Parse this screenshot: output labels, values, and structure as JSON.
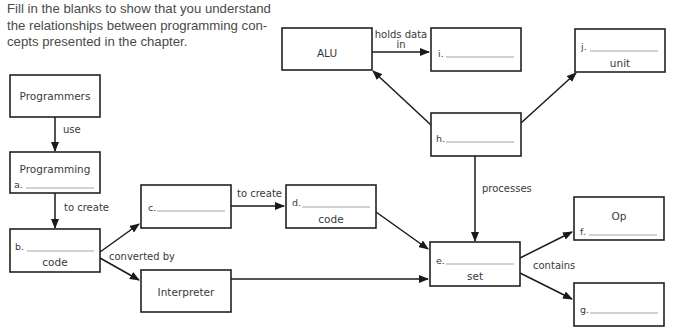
{
  "instructions": {
    "lines": [
      "Fill in the blanks to show that you understand",
      "the relationships between programming con-",
      "cepts presented in the chapter."
    ]
  },
  "nodes": {
    "programmers": {
      "title": "Programmers"
    },
    "programming": {
      "title": "Programming",
      "blank_letter": "a."
    },
    "b": {
      "blank_letter": "b.",
      "suffix": "code"
    },
    "c": {
      "blank_letter": "c."
    },
    "d": {
      "blank_letter": "d.",
      "suffix": "code"
    },
    "interpreter": {
      "title": "Interpreter"
    },
    "alu": {
      "title": "ALU"
    },
    "i": {
      "blank_letter": "i."
    },
    "h": {
      "blank_letter": "h."
    },
    "j": {
      "blank_letter": "j.",
      "suffix": "unit"
    },
    "e": {
      "blank_letter": "e.",
      "suffix": "set"
    },
    "f": {
      "title": "Op",
      "blank_letter": "f."
    },
    "g": {
      "blank_letter": "g."
    }
  },
  "edges": {
    "use": "use",
    "to_create_1": "to create",
    "converted_by": "converted by",
    "to_create_2": "to create",
    "holds_data_line1": "holds data",
    "holds_data_line2": "in",
    "processes": "processes",
    "contains": "contains"
  }
}
